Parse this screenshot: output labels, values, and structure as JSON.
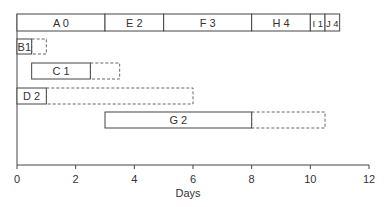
{
  "chart_data": {
    "type": "gantt",
    "title": "",
    "xlabel": "Days",
    "ylabel": "",
    "xlim": [
      0,
      12
    ],
    "xticks": [
      0,
      2,
      4,
      6,
      8,
      10,
      12
    ],
    "grid": false,
    "critical_path_row": [
      {
        "label": "A  0",
        "start": 0,
        "end": 3
      },
      {
        "label": "E  2",
        "start": 3,
        "end": 5
      },
      {
        "label": "F  3",
        "start": 5,
        "end": 8
      },
      {
        "label": "H  4",
        "start": 8,
        "end": 10
      },
      {
        "label": "I 1",
        "start": 10,
        "end": 10.5
      },
      {
        "label": "J 4",
        "start": 10.5,
        "end": 11
      }
    ],
    "activities": [
      {
        "label": "B1",
        "start": 0,
        "end": 0.5,
        "float_end": 1
      },
      {
        "label": "C  1",
        "start": 0.5,
        "end": 2.5,
        "float_end": 3.5
      },
      {
        "label": "D  2",
        "start": 0,
        "end": 1,
        "float_end": 6
      },
      {
        "label": "G  2",
        "start": 3,
        "end": 8,
        "float_end": 10.5
      }
    ]
  }
}
